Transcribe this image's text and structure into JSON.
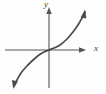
{
  "figure": {
    "name": "coordinate-plane-graph",
    "background_color": "#fefefe",
    "stroke_color": "#4a4a4a",
    "axis_color": "#555555",
    "width": 106,
    "height": 94
  },
  "labels": {
    "x_axis": "x",
    "y_axis": "y"
  },
  "chart_data": {
    "type": "line",
    "title": "",
    "xlabel": "x",
    "ylabel": "y",
    "grid": false,
    "legend": null,
    "axes": {
      "x_axis_y_pixel": 50,
      "y_axis_x_pixel": 49,
      "x_axis_from_pixel": 5,
      "x_axis_to_pixel": 86,
      "y_axis_from_pixel": 8,
      "y_axis_to_pixel": 88,
      "x_arrow": "right",
      "y_arrow": "up",
      "origin_pixel": [
        49,
        50
      ],
      "tick_labels_x": [],
      "tick_labels_y": []
    },
    "series": [
      {
        "name": "odd-symmetric increasing curve through origin",
        "description": "S-shaped cubic-like curve passing through the origin, arrowheads at both ends",
        "arrow_start": "down-left",
        "arrow_end": "up-right",
        "points_pixel": [
          [
            14,
            86
          ],
          [
            17,
            80
          ],
          [
            21,
            73
          ],
          [
            26,
            67
          ],
          [
            32,
            61
          ],
          [
            39,
            55
          ],
          [
            44,
            52
          ],
          [
            49,
            50
          ],
          [
            54,
            48
          ],
          [
            60,
            45
          ],
          [
            67,
            39
          ],
          [
            73,
            32
          ],
          [
            78,
            25
          ],
          [
            82,
            18
          ],
          [
            85,
            12
          ]
        ]
      }
    ]
  }
}
